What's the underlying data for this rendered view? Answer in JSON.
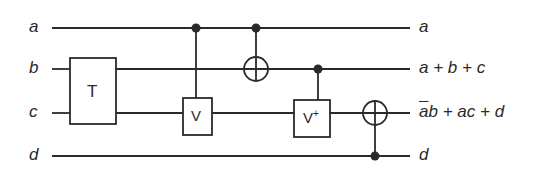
{
  "diagram": {
    "type": "reversible-circuit",
    "inputs": [
      "a",
      "b",
      "c",
      "d"
    ],
    "outputs": {
      "a": "a",
      "b": "a + b + c",
      "c_bar_part": "a",
      "c_rest": "b + ac + d",
      "d": "d"
    },
    "gates": {
      "t": "T",
      "v": "V",
      "vdag": "V",
      "vdag_sup": "+"
    }
  },
  "colors": {
    "line": "#2a2a2a",
    "background": "#ffffff"
  }
}
